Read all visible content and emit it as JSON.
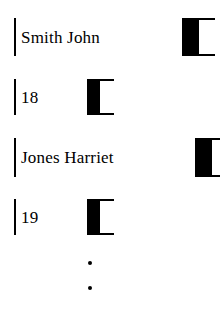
{
  "diagram": {
    "type": "linked-record-nodes",
    "background_color": "#ffffff",
    "ink_color": "#000000",
    "nodes": [
      {
        "id": "node-name-1",
        "data_label": "Smith John",
        "pointer_label": "",
        "x": 14,
        "y": 18,
        "height": 38,
        "data_width": 170,
        "pointer_width": 15,
        "tail_width": 16
      },
      {
        "id": "node-age-1",
        "data_label": "18",
        "pointer_label": "",
        "x": 14,
        "y": 79,
        "height": 36,
        "data_width": 75,
        "pointer_width": 11,
        "tail_width": 14
      },
      {
        "id": "node-name-2",
        "data_label": "Jones Harriet",
        "pointer_label": "",
        "x": 14,
        "y": 138,
        "height": 39,
        "data_width": 183,
        "pointer_width": 15,
        "tail_width": 8
      },
      {
        "id": "node-age-2",
        "data_label": "19",
        "pointer_label": "",
        "x": 14,
        "y": 199,
        "height": 36,
        "data_width": 75,
        "pointer_width": 11,
        "tail_width": 14
      }
    ],
    "ellipsis": {
      "label": "continues",
      "dots": [
        {
          "x": 88,
          "y": 261
        },
        {
          "x": 88,
          "y": 286
        }
      ]
    }
  }
}
